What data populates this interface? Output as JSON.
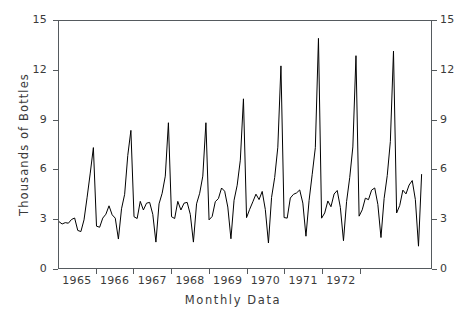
{
  "chart_data": {
    "type": "line",
    "title": "",
    "subtitle": "",
    "xlabel": "Monthly Data",
    "ylabel": "Thousands of Bottles",
    "ylim": [
      0,
      15
    ],
    "yticks": [
      0,
      3,
      6,
      9,
      12,
      15
    ],
    "ytick_labels": [
      "0",
      "3",
      "6",
      "9",
      "12",
      "15"
    ],
    "ytick_labels_right": [
      "0",
      "3",
      "6",
      "9",
      "12",
      "15"
    ],
    "xlim_labels": [
      "1965",
      "1966",
      "1967",
      "1968",
      "1969",
      "1970",
      "1971",
      "1972"
    ],
    "xtick_labels": [
      "1965",
      "1966",
      "1967",
      "1968",
      "1969",
      "1970",
      "1971",
      "1972"
    ],
    "x_start_index": 0,
    "x_points_per_year": 12,
    "grid": false,
    "legend": null,
    "legend_position": "none",
    "line_color": "#000000",
    "axis_color": "#555a5e",
    "text_color": "#3a3a3a",
    "background": "#ffffff",
    "series": [
      {
        "name": "Monthly champagne sales",
        "values": [
          2.815,
          2.672,
          2.755,
          2.721,
          2.946,
          3.036,
          2.282,
          2.212,
          2.922,
          4.301,
          5.764,
          7.312,
          2.541,
          2.475,
          3.031,
          3.266,
          3.776,
          3.23,
          3.028,
          1.759,
          3.595,
          4.474,
          6.838,
          8.357,
          3.113,
          3.006,
          4.047,
          3.523,
          3.937,
          3.986,
          3.26,
          1.573,
          3.895,
          4.539,
          5.579,
          8.821,
          3.113,
          3.006,
          4.047,
          3.523,
          3.937,
          3.986,
          3.26,
          1.573,
          3.895,
          4.539,
          5.579,
          8.821,
          2.925,
          3.132,
          4.031,
          4.217,
          4.858,
          4.663,
          3.701,
          1.776,
          4.114,
          5.027,
          6.549,
          10.274,
          3.059,
          3.566,
          4.018,
          4.484,
          4.155,
          4.65,
          3.551,
          1.518,
          4.286,
          5.498,
          7.337,
          12.274,
          3.063,
          3.029,
          4.249,
          4.473,
          4.561,
          4.74,
          3.942,
          1.93,
          4.105,
          5.692,
          7.309,
          13.945,
          3.026,
          3.343,
          4.07,
          3.721,
          4.492,
          4.707,
          3.68,
          1.657,
          4.044,
          5.493,
          7.352,
          12.893,
          3.148,
          3.532,
          4.24,
          4.15,
          4.73,
          4.86,
          3.86,
          1.85,
          4.22,
          5.61,
          7.68,
          13.171,
          3.341,
          3.8,
          4.73,
          4.5,
          5.04,
          5.31,
          4.15,
          1.325,
          5.702
        ]
      }
    ],
    "annotations": []
  }
}
